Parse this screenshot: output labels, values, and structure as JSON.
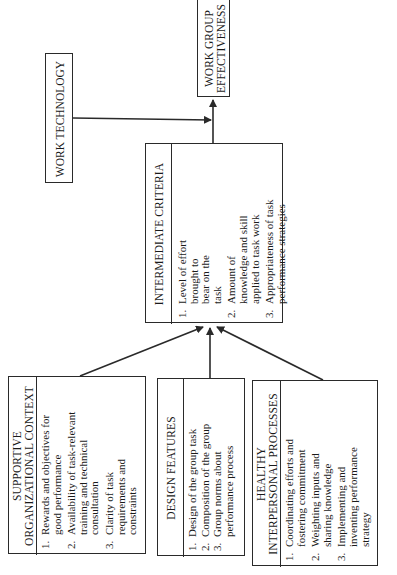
{
  "diagram": {
    "type": "flow",
    "orientation": "rotated-90-ccw",
    "nodes": {
      "work_technology": {
        "label": "WORK TECHNOLOGY"
      },
      "work_group_effectiveness": {
        "label_line1": "WORK GROUP",
        "label_line2": "EFFECTIVENESS"
      },
      "intermediate_criteria": {
        "title": "INTERMEDIATE CRITERIA",
        "items": [
          "Level of effort brought to bear on the task",
          "Amount of knowledge and skill applied to task work",
          "Appropriateness of task performance strategies"
        ]
      },
      "supportive_context": {
        "title_line1": "SUPPORTIVE",
        "title_line2": "ORGANIZATIONAL CONTEXT",
        "items": [
          "Rewards and objectives for good performance",
          "Availability of task-relevant training and technical consultation",
          "Clarity of task requirements and constraints"
        ]
      },
      "design_features": {
        "title": "DESIGN FEATURES",
        "items": [
          "Design of the group task",
          "Composition of the group",
          "Group norms about performance process"
        ]
      },
      "healthy_processes": {
        "title_line1": "HEALTHY",
        "title_line2": "INTERPERSONAL PROCESSES",
        "items": [
          "Coordinating efforts and fostering commitment",
          "Weighting inputs and sharing knowledge",
          "Implementing and inventing performance strategy"
        ]
      }
    },
    "edges": [
      {
        "from": "supportive_context",
        "to": "intermediate_criteria"
      },
      {
        "from": "design_features",
        "to": "intermediate_criteria"
      },
      {
        "from": "healthy_processes",
        "to": "intermediate_criteria"
      },
      {
        "from": "intermediate_criteria",
        "to": "work_group_effectiveness"
      },
      {
        "from": "work_technology",
        "to": "work_group_effectiveness"
      }
    ],
    "colors": {
      "line": "#2a2a2a",
      "background": "#ffffff"
    }
  }
}
